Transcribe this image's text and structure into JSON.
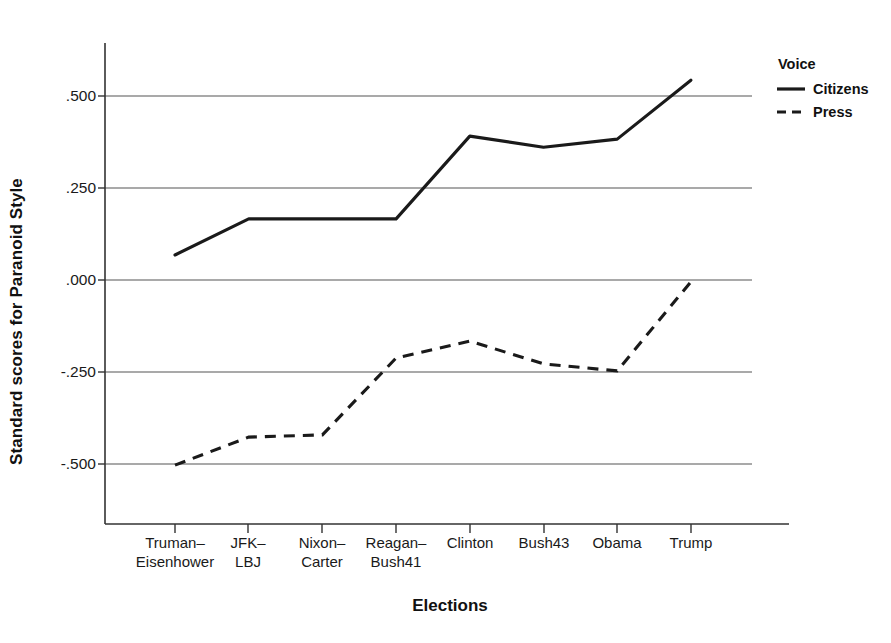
{
  "chart_data": {
    "type": "line",
    "title": "",
    "xlabel": "Elections",
    "ylabel": "Standard scores for Paranoid Style",
    "categories": [
      "Truman–\nEisenhower",
      "JFK–\nLBJ",
      "Nixon–\nCarter",
      "Reagan–\nBush41",
      "Clinton",
      "Bush43",
      "Obama",
      "Trump"
    ],
    "ylim": [
      -0.625,
      0.675
    ],
    "yticks": [
      0.5,
      0.25,
      0.0,
      -0.25,
      -0.5
    ],
    "ytick_labels": [
      ".500",
      ".250",
      ".000",
      "-.250",
      "-.500"
    ],
    "grid": "horizontal",
    "legend_position": "right",
    "legend_title": "Voice",
    "series": [
      {
        "name": "Citizens",
        "style": "solid",
        "color": "#1a1a1a",
        "values": [
          0.068,
          0.166,
          0.166,
          0.166,
          0.391,
          0.361,
          0.383,
          0.543
        ]
      },
      {
        "name": "Press",
        "style": "dashed",
        "color": "#1a1a1a",
        "values": [
          -0.503,
          -0.427,
          -0.421,
          -0.212,
          -0.166,
          -0.228,
          -0.247,
          -0.005
        ]
      }
    ]
  },
  "legend": {
    "title": "Voice",
    "entries": [
      {
        "label": "Citizens",
        "style": "solid"
      },
      {
        "label": "Press",
        "style": "dashed"
      }
    ]
  },
  "axes": {
    "y_title": "Standard scores for Paranoid Style",
    "x_title": "Elections",
    "y_tick_labels": [
      ".500",
      ".250",
      ".000",
      "-.250",
      "-.500"
    ],
    "x_tick_labels": [
      {
        "line1": "Truman–",
        "line2": "Eisenhower"
      },
      {
        "line1": "JFK–",
        "line2": "LBJ"
      },
      {
        "line1": "Nixon–",
        "line2": "Carter"
      },
      {
        "line1": "Reagan–",
        "line2": "Bush41"
      },
      {
        "line1": "Clinton",
        "line2": ""
      },
      {
        "line1": "Bush43",
        "line2": ""
      },
      {
        "line1": "Obama",
        "line2": ""
      },
      {
        "line1": "Trump",
        "line2": ""
      }
    ]
  },
  "colors": {
    "line": "#1a1a1a",
    "grid": "#4d4d4d",
    "axis": "#333333",
    "background": "#ffffff"
  }
}
